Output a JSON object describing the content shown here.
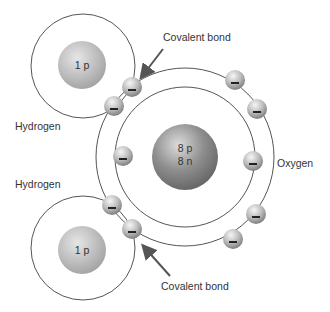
{
  "diagram": {
    "colors": {
      "orbit": "#555555",
      "arrow": "#555555",
      "hydrogen_nucleus_light": "#e0e0e0",
      "hydrogen_nucleus_dark": "#a8a8a8",
      "oxygen_nucleus_light": "#d8d8d8",
      "oxygen_nucleus_dark": "#6e6e6e",
      "electron_light": "#f2f2f2",
      "electron_dark": "#8a8a8a",
      "text": "#333333"
    },
    "atoms": [
      {
        "name": "Hydrogen",
        "position": "top",
        "nucleus_label": "1 p"
      },
      {
        "name": "Oxygen",
        "position": "center",
        "nucleus_label_line1": "8 p",
        "nucleus_label_line2": "8 n"
      },
      {
        "name": "Hydrogen",
        "position": "bottom",
        "nucleus_label": "1 p"
      }
    ],
    "labels": {
      "covalent_bond_top": "Covalent bond",
      "covalent_bond_bottom": "Covalent bond",
      "hydrogen_top": "Hydrogen",
      "hydrogen_bottom": "Hydrogen",
      "oxygen": "Oxygen"
    },
    "electron_symbol": "−",
    "electron_count": {
      "oxygen_inner_shell": 2,
      "oxygen_outer_shell": 6,
      "shared_pairs": 2
    }
  }
}
